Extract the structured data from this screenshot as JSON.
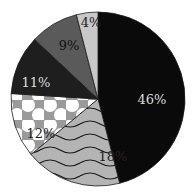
{
  "chart_data": {
    "type": "pie",
    "title": "",
    "start_angle_deg": 0,
    "direction": "clockwise",
    "slices": [
      {
        "label": "46%",
        "value": 46,
        "fill": "#0a0a0a",
        "pattern": "solid",
        "text_color": "#dddddd"
      },
      {
        "label": "18%",
        "value": 18,
        "fill": "#b4b4b4",
        "pattern": "waves",
        "text_color": "#222222"
      },
      {
        "label": "12%",
        "value": 12,
        "fill": "#9a9a9a",
        "pattern": "dots",
        "text_color": "#222222"
      },
      {
        "label": "11%",
        "value": 11,
        "fill": "#1e1e1e",
        "pattern": "solid",
        "text_color": "#dddddd"
      },
      {
        "label": "9%",
        "value": 9,
        "fill": "#5a5a5a",
        "pattern": "solid",
        "text_color": "#111111"
      },
      {
        "label": "4%",
        "value": 4,
        "fill": "#c8c8c8",
        "pattern": "solid",
        "text_color": "#222222"
      }
    ],
    "legend": "none",
    "grid": false
  }
}
